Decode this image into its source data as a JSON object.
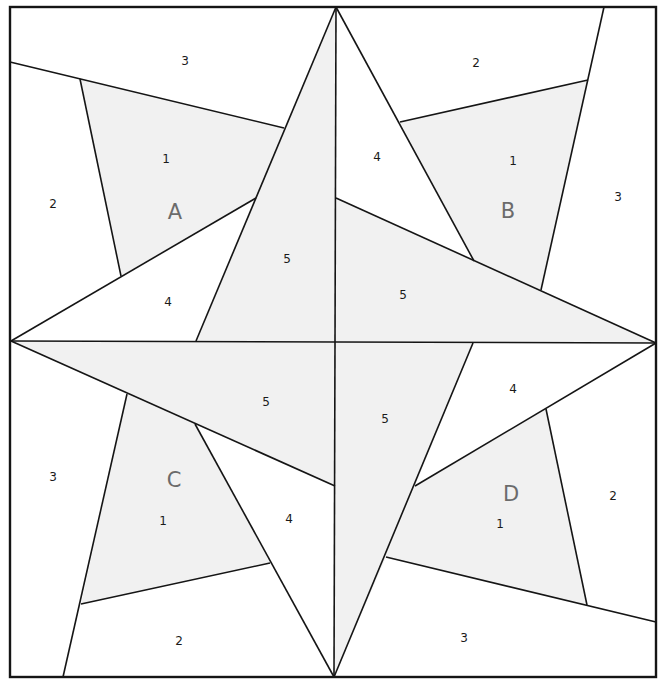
{
  "diagram": {
    "type": "foundation paper piecing pattern",
    "sections": [
      {
        "letter": "A",
        "pieces": [
          "1",
          "2",
          "3",
          "4",
          "5"
        ]
      },
      {
        "letter": "B",
        "pieces": [
          "1",
          "2",
          "3",
          "4",
          "5"
        ]
      },
      {
        "letter": "C",
        "pieces": [
          "1",
          "2",
          "3",
          "4",
          "5"
        ]
      },
      {
        "letter": "D",
        "pieces": [
          "1",
          "2",
          "3",
          "4",
          "5"
        ]
      }
    ],
    "labels": {
      "A": {
        "letter": "A",
        "p1": "1",
        "p2": "2",
        "p3": "3",
        "p4": "4",
        "p5": "5"
      },
      "B": {
        "letter": "B",
        "p1": "1",
        "p2": "2",
        "p3": "3",
        "p4": "4",
        "p5": "5"
      },
      "C": {
        "letter": "C",
        "p1": "1",
        "p2": "2",
        "p3": "3",
        "p4": "4",
        "p5": "5"
      },
      "D": {
        "letter": "D",
        "p1": "1",
        "p2": "2",
        "p3": "3",
        "p4": "4",
        "p5": "5"
      }
    },
    "colors": {
      "line": "#151515",
      "shaded_fill": "#f1f1f1",
      "background": "#ffffff",
      "letter_color": "#6b6b6b"
    }
  }
}
